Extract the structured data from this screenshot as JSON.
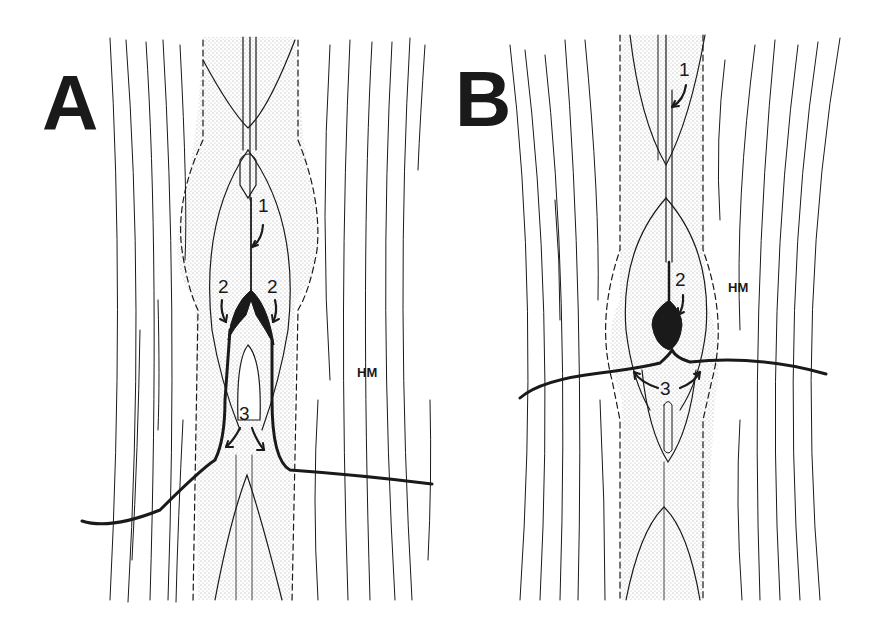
{
  "figure": {
    "type": "schematic anatomical diagram",
    "panels": [
      {
        "letter": "A",
        "labels": {
          "n1": "1",
          "n2_left": "2",
          "n2_right": "2",
          "n3": "3",
          "region": "HM"
        }
      },
      {
        "letter": "B",
        "labels": {
          "n1": "1",
          "n2": "2",
          "n3": "3",
          "region": "HM"
        }
      }
    ],
    "colors": {
      "ink": "#1a1a1a",
      "stipple": "#c8c8c8",
      "background": "#ffffff"
    }
  }
}
